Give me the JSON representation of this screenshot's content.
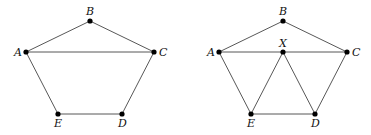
{
  "figures": [
    {
      "name": "pentagon-left",
      "nodes": [
        {
          "id": "A",
          "x": 26,
          "y": 52,
          "lx": 14,
          "ly": 56
        },
        {
          "id": "B",
          "x": 90,
          "y": 21,
          "lx": 86,
          "ly": 15
        },
        {
          "id": "C",
          "x": 154,
          "y": 52,
          "lx": 159,
          "ly": 56
        },
        {
          "id": "D",
          "x": 122,
          "y": 114,
          "lx": 118,
          "ly": 127
        },
        {
          "id": "E",
          "x": 58,
          "y": 114,
          "lx": 54,
          "ly": 127
        }
      ],
      "edges": [
        [
          "A",
          "B"
        ],
        [
          "B",
          "C"
        ],
        [
          "A",
          "C"
        ],
        [
          "A",
          "E"
        ],
        [
          "E",
          "D"
        ],
        [
          "D",
          "C"
        ]
      ]
    },
    {
      "name": "pentagon-right",
      "nodes": [
        {
          "id": "A",
          "x": 219,
          "y": 52,
          "lx": 207,
          "ly": 56
        },
        {
          "id": "B",
          "x": 283,
          "y": 21,
          "lx": 279,
          "ly": 15
        },
        {
          "id": "C",
          "x": 347,
          "y": 52,
          "lx": 352,
          "ly": 56
        },
        {
          "id": "X",
          "x": 283,
          "y": 52,
          "lx": 279,
          "ly": 47
        },
        {
          "id": "D",
          "x": 315,
          "y": 114,
          "lx": 311,
          "ly": 127
        },
        {
          "id": "E",
          "x": 251,
          "y": 114,
          "lx": 247,
          "ly": 127
        }
      ],
      "edges": [
        [
          "A",
          "B"
        ],
        [
          "B",
          "C"
        ],
        [
          "A",
          "C"
        ],
        [
          "A",
          "E"
        ],
        [
          "E",
          "D"
        ],
        [
          "D",
          "C"
        ],
        [
          "X",
          "E"
        ],
        [
          "X",
          "D"
        ]
      ]
    }
  ]
}
